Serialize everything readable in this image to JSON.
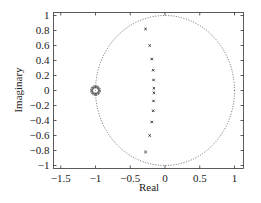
{
  "chart_data": {
    "type": "scatter",
    "title": "",
    "xlabel": "Real",
    "ylabel": "Imaginary",
    "xlim": [
      -1.55,
      1.1
    ],
    "ylim": [
      -1.05,
      1.05
    ],
    "grid": false,
    "xticks": [
      -1.5,
      -1,
      -0.5,
      0,
      0.5,
      1
    ],
    "xtick_labels": [
      "−1.5",
      "−1",
      "−0.5",
      "0",
      "0.5",
      "1"
    ],
    "yticks": [
      1,
      0.8,
      0.6,
      0.4,
      0.2,
      0,
      -0.2,
      -0.4,
      -0.6,
      -0.8,
      -1
    ],
    "ytick_labels": [
      "1",
      "0.8",
      "0.6",
      "0.4",
      "0.2",
      "0",
      "−0.2",
      "−0.4",
      "−0.6",
      "−0.8",
      "−1"
    ],
    "unit_circle": {
      "center": [
        0,
        0
      ],
      "radius": 1,
      "style": "dotted"
    },
    "series": [
      {
        "name": "zeros",
        "marker": "circle (multiple overlapping)",
        "points": [
          [
            -1.0,
            0.0
          ]
        ]
      },
      {
        "name": "poles",
        "marker": "x",
        "points": [
          [
            -0.28,
            0.82
          ],
          [
            -0.22,
            0.6
          ],
          [
            -0.19,
            0.42
          ],
          [
            -0.17,
            0.27
          ],
          [
            -0.165,
            0.14
          ],
          [
            -0.16,
            0.03
          ],
          [
            -0.16,
            -0.03
          ],
          [
            -0.165,
            -0.14
          ],
          [
            -0.17,
            -0.27
          ],
          [
            -0.19,
            -0.42
          ],
          [
            -0.22,
            -0.6
          ],
          [
            -0.28,
            -0.82
          ]
        ]
      }
    ]
  }
}
